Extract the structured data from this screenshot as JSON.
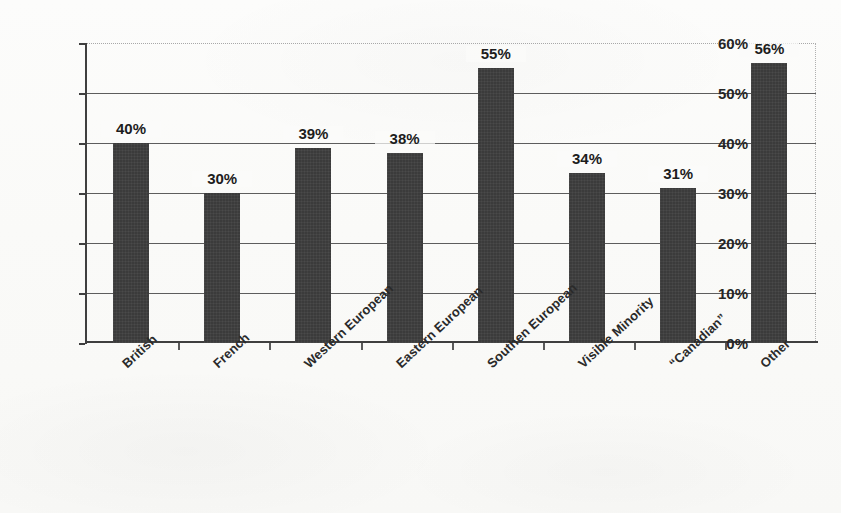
{
  "chart_data": {
    "type": "bar",
    "title": "",
    "xlabel": "",
    "ylabel": "",
    "ylim": [
      0,
      60
    ],
    "ytick_labels": [
      "60%",
      "50%",
      "40%",
      "30%",
      "20%",
      "10%",
      "0%"
    ],
    "ytick_values": [
      60,
      50,
      40,
      30,
      20,
      10,
      0
    ],
    "grid": true,
    "legend": "none",
    "bar_color": "#3b3b3b",
    "categories": [
      "British",
      "French",
      "Western European",
      "Eastern European",
      "Southen European",
      "Visible Minority",
      "“Canadian”",
      "Other"
    ],
    "values": [
      40,
      30,
      39,
      38,
      55,
      34,
      31,
      56
    ],
    "data_labels": [
      "40%",
      "30%",
      "39%",
      "38%",
      "55%",
      "34%",
      "31%",
      "56%"
    ]
  },
  "axis": {
    "y_ticks": [
      {
        "label": "60%",
        "value": 60
      },
      {
        "label": "50%",
        "value": 50
      },
      {
        "label": "40%",
        "value": 40
      },
      {
        "label": "30%",
        "value": 30
      },
      {
        "label": "20%",
        "value": 20
      },
      {
        "label": "10%",
        "value": 10
      },
      {
        "label": "0%",
        "value": 0
      }
    ]
  }
}
